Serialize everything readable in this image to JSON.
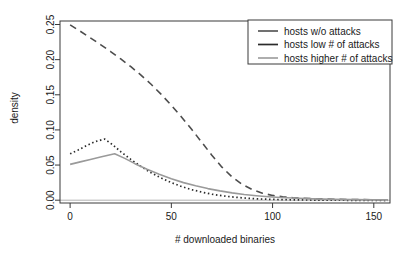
{
  "chart_data": {
    "type": "line",
    "title": "",
    "xlabel": "# downloaded binaries",
    "ylabel": "density",
    "xlim": [
      -5,
      158
    ],
    "ylim": [
      -0.004,
      0.255
    ],
    "xticks": [
      0,
      50,
      100,
      150
    ],
    "xtick_labels": [
      "0",
      "50",
      "100",
      "150"
    ],
    "yticks": [
      0.0,
      0.05,
      0.1,
      0.15,
      0.2,
      0.25
    ],
    "ytick_labels": [
      "0.00",
      "0.05",
      "0.10",
      "0.15",
      "0.20",
      "0.25"
    ],
    "grid": false,
    "legend_position": "top-right",
    "series": [
      {
        "name": "hosts w/o attacks",
        "style": "dashed",
        "color": "#4d4d4d",
        "width": 1.6,
        "dash": "7,5",
        "x": [
          0,
          5,
          10,
          15,
          20,
          25,
          30,
          35,
          40,
          45,
          50,
          55,
          60,
          65,
          70,
          75,
          80,
          85,
          90,
          95,
          100,
          105,
          110,
          120,
          130,
          140,
          150,
          157
        ],
        "y": [
          0.2495,
          0.2405,
          0.231,
          0.2215,
          0.2115,
          0.201,
          0.19,
          0.178,
          0.165,
          0.1505,
          0.135,
          0.1185,
          0.101,
          0.0825,
          0.064,
          0.047,
          0.033,
          0.0225,
          0.015,
          0.01,
          0.0068,
          0.0048,
          0.0035,
          0.0022,
          0.0014,
          0.0009,
          0.0006,
          0.0005
        ]
      },
      {
        "name": "hosts low # of attacks",
        "style": "dotted",
        "color": "#2b2b2b",
        "width": 1.7,
        "dash": "1.5,2.6",
        "x": [
          0,
          4,
          8,
          12,
          17,
          21,
          25,
          30,
          35,
          40,
          45,
          50,
          55,
          60,
          65,
          70,
          75,
          80,
          85,
          90,
          95,
          100,
          110,
          120,
          130,
          140,
          150,
          157
        ],
        "y": [
          0.066,
          0.0715,
          0.0775,
          0.083,
          0.087,
          0.079,
          0.069,
          0.058,
          0.048,
          0.039,
          0.0315,
          0.025,
          0.0195,
          0.015,
          0.0115,
          0.0085,
          0.0063,
          0.0046,
          0.0033,
          0.0023,
          0.0016,
          0.0011,
          0.0005,
          0.0002,
          0.0,
          -0.0002,
          -0.0004,
          -0.0005
        ]
      },
      {
        "name": "hosts higher # of attacks",
        "style": "solid",
        "color": "#9a9a9a",
        "width": 1.6,
        "dash": "none",
        "x": [
          0,
          5,
          10,
          15,
          22,
          27,
          32,
          38,
          44,
          50,
          56,
          62,
          68,
          74,
          80,
          86,
          92,
          98,
          104,
          110,
          120,
          130,
          140,
          150,
          157
        ],
        "y": [
          0.051,
          0.0545,
          0.058,
          0.0615,
          0.066,
          0.0595,
          0.052,
          0.044,
          0.037,
          0.0305,
          0.025,
          0.0205,
          0.0165,
          0.0132,
          0.0104,
          0.0082,
          0.0064,
          0.005,
          0.0039,
          0.0031,
          0.0019,
          0.0012,
          0.0008,
          0.0005,
          0.0004
        ]
      }
    ],
    "baseline": {
      "value": 0.0,
      "color": "#b3b3b3"
    }
  },
  "legend": {
    "entries": [
      {
        "label": "hosts w/o attacks"
      },
      {
        "label": "hosts low # of attacks"
      },
      {
        "label": "hosts higher # of attacks"
      }
    ]
  }
}
